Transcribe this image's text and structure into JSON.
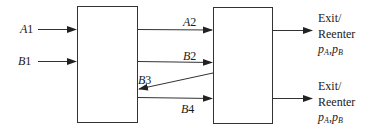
{
  "diagram": {
    "colors": {
      "stroke": "#333333",
      "text": "#1a1a1a",
      "background": "#ffffff"
    },
    "boxes": [
      {
        "id": "left-block",
        "x": 77,
        "y": 6,
        "w": 60,
        "h": 116
      },
      {
        "id": "right-block",
        "x": 213,
        "y": 7,
        "w": 59,
        "h": 116
      }
    ],
    "inputs": [
      {
        "label_var": "A",
        "label_idx": "1",
        "y": 29
      },
      {
        "label_var": "B",
        "label_idx": "1",
        "y": 61
      }
    ],
    "flows": [
      {
        "label_var": "A",
        "label_idx": "2",
        "direction": "left-to-right",
        "y": 29
      },
      {
        "label_var": "B",
        "label_idx": "2",
        "direction": "left-to-right",
        "y": 62
      },
      {
        "label_var": "B",
        "label_idx": "3",
        "direction": "right-to-left",
        "from_y": 73,
        "to_y": 89
      },
      {
        "label_var": "B",
        "label_idx": "4",
        "direction": "left-to-right",
        "y": 98
      }
    ],
    "outputs": [
      {
        "line1": "Exit/",
        "line2": "Reenter",
        "p1": "p",
        "p1_sub": "A",
        "sep": ",",
        "p2": "p",
        "p2_sub": "B",
        "y": 30
      },
      {
        "line1": "Exit/",
        "line2": "Reenter",
        "p1": "p",
        "p1_sub": "A",
        "sep": ",",
        "p2": "p",
        "p2_sub": "B",
        "y": 98
      }
    ]
  }
}
